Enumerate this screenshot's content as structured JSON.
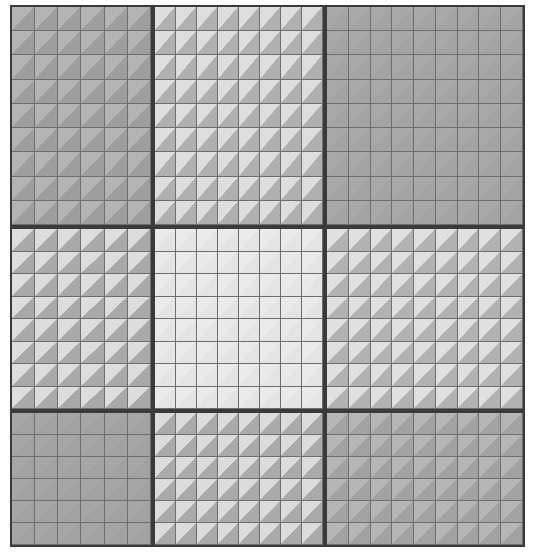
{
  "figure": {
    "type": "heatmap-matrix",
    "title": "",
    "background_color": "#ffffff",
    "width": 535,
    "height": 552,
    "block_border_color": "#3a3a3a",
    "cell_grid_color": "#6e6e6e"
  },
  "chart_data": {
    "type": "heatmap",
    "title": "",
    "xlabel": "",
    "ylabel": "",
    "grid": true,
    "legend": "none",
    "block_rows": 3,
    "block_cols": 3,
    "col_cell_counts": [
      6,
      8,
      9
    ],
    "row_cell_counts": [
      9,
      8,
      6
    ],
    "col_widths_px": [
      143,
      172,
      200
    ],
    "row_heights_px": [
      222,
      184,
      136
    ],
    "value_scale": "light = low, dark = high",
    "blocks": [
      {
        "row": 0,
        "col": 0,
        "name": "top-left",
        "cells_x": 6,
        "cells_y": 9,
        "base_color": "#a8a8a8",
        "upper_triangle_color": "#b4b4b4",
        "lower_triangle_color": "#9e9e9e",
        "contrast": 0.12,
        "value": 0.66
      },
      {
        "row": 0,
        "col": 1,
        "name": "top-center",
        "cells_x": 8,
        "cells_y": 9,
        "base_color": "#cbcbcb",
        "upper_triangle_color": "#dedede",
        "lower_triangle_color": "#b0b0b0",
        "contrast": 0.62,
        "value": 0.38
      },
      {
        "row": 0,
        "col": 2,
        "name": "top-right",
        "cells_x": 9,
        "cells_y": 9,
        "base_color": "#a6a6a6",
        "upper_triangle_color": "#a8a8a8",
        "lower_triangle_color": "#a4a4a4",
        "contrast": 0.02,
        "value": 0.68
      },
      {
        "row": 1,
        "col": 0,
        "name": "middle-left",
        "cells_x": 6,
        "cells_y": 8,
        "base_color": "#c6c6c6",
        "upper_triangle_color": "#dddddd",
        "lower_triangle_color": "#a9a9a9",
        "contrast": 0.78,
        "value": 0.41
      },
      {
        "row": 1,
        "col": 1,
        "name": "middle-center",
        "cells_x": 8,
        "cells_y": 8,
        "base_color": "#e8e8e8",
        "upper_triangle_color": "#eaeaea",
        "lower_triangle_color": "#e4e4e4",
        "contrast": 0.03,
        "value": 0.09
      },
      {
        "row": 1,
        "col": 2,
        "name": "middle-right",
        "cells_x": 9,
        "cells_y": 8,
        "base_color": "#cccccc",
        "upper_triangle_color": "#e0e0e0",
        "lower_triangle_color": "#b2b2b2",
        "contrast": 0.72,
        "value": 0.37
      },
      {
        "row": 2,
        "col": 0,
        "name": "bottom-left",
        "cells_x": 6,
        "cells_y": 6,
        "base_color": "#a4a4a4",
        "upper_triangle_color": "#a6a6a6",
        "lower_triangle_color": "#a2a2a2",
        "contrast": 0.02,
        "value": 0.69
      },
      {
        "row": 2,
        "col": 1,
        "name": "bottom-center",
        "cells_x": 8,
        "cells_y": 6,
        "base_color": "#c7c7c7",
        "upper_triangle_color": "#dcdcdc",
        "lower_triangle_color": "#aaaaaa",
        "contrast": 0.74,
        "value": 0.4
      },
      {
        "row": 2,
        "col": 2,
        "name": "bottom-right",
        "cells_x": 9,
        "cells_y": 6,
        "base_color": "#ababab",
        "upper_triangle_color": "#b6b6b6",
        "lower_triangle_color": "#a2a2a2",
        "contrast": 0.14,
        "value": 0.65
      }
    ]
  }
}
